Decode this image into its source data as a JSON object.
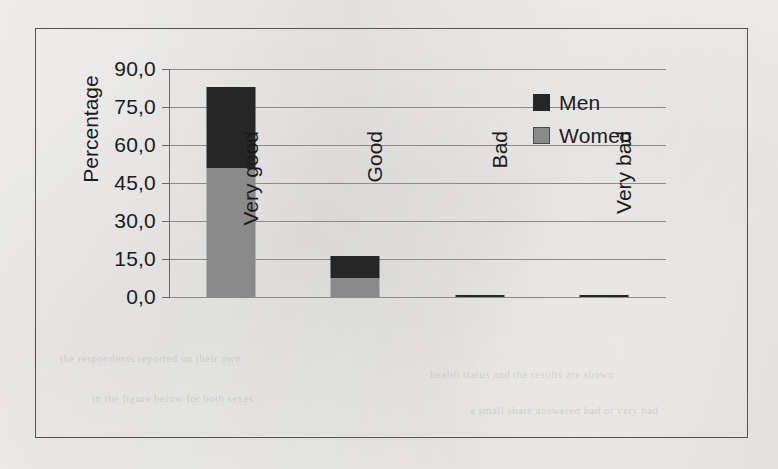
{
  "chart_data": {
    "type": "bar",
    "subtype": "stacked-column",
    "title": "",
    "xlabel": "",
    "ylabel": "Percentage",
    "categories": [
      "Very good",
      "Good",
      "Bad",
      "Very bad"
    ],
    "series": [
      {
        "name": "Women",
        "color": "#8a8a8a",
        "values": [
          51.0,
          7.5,
          0.0,
          0.0
        ]
      },
      {
        "name": "Men",
        "color": "#262626",
        "values": [
          32.0,
          8.7,
          0.6,
          0.6
        ]
      }
    ],
    "totals": [
      83.0,
      16.2,
      0.6,
      0.6
    ],
    "ylim": [
      0,
      90
    ],
    "ytick_values": [
      90,
      75,
      60,
      45,
      30,
      15,
      0
    ],
    "ytick_labels": [
      "90,0",
      "75,0",
      "60,0",
      "45,0",
      "30,0",
      "15,0",
      "0,0"
    ],
    "grid": true,
    "grid_axis": "y",
    "legend_position": "inside-top-right",
    "decimal_separator": ",",
    "stack_order": [
      "Women",
      "Men"
    ]
  },
  "legend": {
    "items": [
      {
        "label": "Men",
        "color": "#262626"
      },
      {
        "label": "Women",
        "color": "#8a8a8a"
      }
    ]
  },
  "background_text": {
    "lines": [
      "the respondents reported on their own",
      "health status and the results are shown",
      "in the figure below for both sexes",
      "a small share answered bad or very bad"
    ]
  }
}
